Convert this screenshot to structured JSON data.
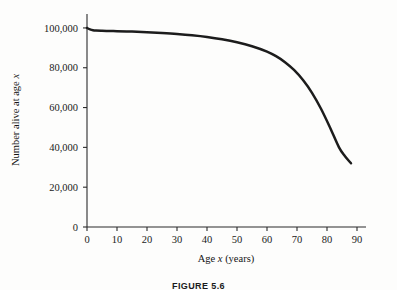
{
  "figure": {
    "caption": "FIGURE 5.6"
  },
  "chart_data": {
    "type": "line",
    "title": "",
    "xlabel": "Age x (years)",
    "xlabel_parts": {
      "pre": "Age ",
      "italic": "x",
      "post": " (years)"
    },
    "ylabel": "Number alive at age x",
    "ylabel_parts": {
      "pre": "Number alive at age ",
      "italic": "x",
      "post": ""
    },
    "xlim": [
      0,
      93
    ],
    "ylim": [
      0,
      107000
    ],
    "xticks": [
      0,
      10,
      20,
      30,
      40,
      50,
      60,
      70,
      80,
      90
    ],
    "xticklabels": [
      "0",
      "10",
      "20",
      "30",
      "40",
      "50",
      "60",
      "70",
      "80",
      "90"
    ],
    "yticks": [
      0,
      20000,
      40000,
      60000,
      80000,
      100000
    ],
    "yticklabels": [
      "0",
      "20,000",
      "40,000",
      "60,000",
      "80,000",
      "100,000"
    ],
    "grid": false,
    "legend": false,
    "series": [
      {
        "name": "Number alive at age x",
        "color": "#1c1c1c",
        "x": [
          0,
          1,
          2,
          3,
          5,
          8,
          10,
          15,
          20,
          25,
          30,
          35,
          40,
          45,
          50,
          55,
          60,
          63,
          66,
          69,
          72,
          75,
          78,
          81,
          84,
          86,
          88
        ],
        "y": [
          100000,
          99250,
          98800,
          98650,
          98550,
          98450,
          98350,
          98150,
          97850,
          97450,
          96950,
          96300,
          95450,
          94300,
          92800,
          90800,
          88100,
          85800,
          82800,
          78900,
          73800,
          67400,
          59400,
          50000,
          40000,
          35500,
          32000
        ]
      }
    ]
  }
}
